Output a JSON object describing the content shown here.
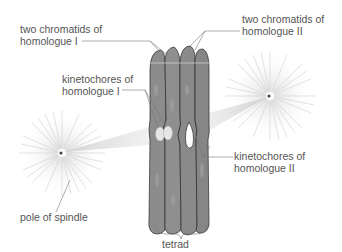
{
  "diagram": {
    "type": "meiosis tetrad with spindle poles",
    "labels": {
      "chromatids_h1_line1": "two chromatids of",
      "chromatids_h1_line2": "homologue I",
      "chromatids_h2_line1": "two chromatids of",
      "chromatids_h2_line2": "homologue II",
      "kinetochores_h1_line1": "kinetochores of",
      "kinetochores_h1_line2": "homologue I",
      "kinetochores_h2_line1": "kinetochores of",
      "kinetochores_h2_line2": "homologue II",
      "pole": "pole of spindle",
      "tetrad": "tetrad"
    },
    "colors": {
      "chromatid_fill": "#8a8a8a",
      "chromatid_outline": "#222222",
      "spindle": "#d8d8d8",
      "label_text": "#555555",
      "leader_line": "#777777"
    }
  }
}
